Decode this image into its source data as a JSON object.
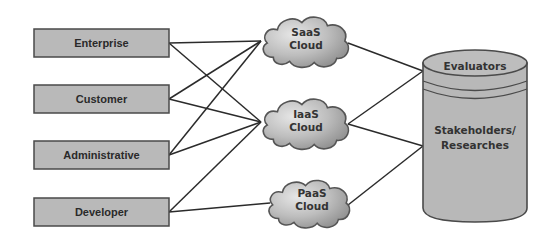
{
  "colors": {
    "box_fill": "#b9b9b9",
    "box_stroke": "#4a4a4a",
    "cloud_fill_light": "#d8d8d8",
    "cloud_fill_dark": "#9a9a9a",
    "cloud_stroke": "#555555",
    "cylinder_fill": "#b8b8b8",
    "cylinder_stroke": "#4a4a4a",
    "line": "#2b2b2b",
    "background": "#ffffff"
  },
  "actors": [
    {
      "id": "enterprise",
      "label": "Enterprise"
    },
    {
      "id": "customer",
      "label": "Customer"
    },
    {
      "id": "administrative",
      "label": "Administrative"
    },
    {
      "id": "developer",
      "label": "Developer"
    }
  ],
  "clouds": [
    {
      "id": "saas",
      "line1": "SaaS",
      "line2": "Cloud"
    },
    {
      "id": "iaas",
      "line1": "IaaS",
      "line2": "Cloud"
    },
    {
      "id": "paas",
      "line1": "PaaS",
      "line2": "Cloud"
    }
  ],
  "cylinder": {
    "top_label": "Evaluators",
    "body_line1": "Stakeholders/",
    "body_line2": "Researches"
  },
  "edges": [
    {
      "from": "enterprise",
      "to": "saas"
    },
    {
      "from": "enterprise",
      "to": "iaas"
    },
    {
      "from": "customer",
      "to": "saas"
    },
    {
      "from": "customer",
      "to": "iaas"
    },
    {
      "from": "administrative",
      "to": "saas"
    },
    {
      "from": "administrative",
      "to": "iaas"
    },
    {
      "from": "developer",
      "to": "iaas"
    },
    {
      "from": "developer",
      "to": "paas"
    },
    {
      "from": "saas",
      "to": "evaluators"
    },
    {
      "from": "iaas",
      "to": "evaluators"
    },
    {
      "from": "iaas",
      "to": "stakeholders"
    },
    {
      "from": "paas",
      "to": "stakeholders"
    }
  ]
}
